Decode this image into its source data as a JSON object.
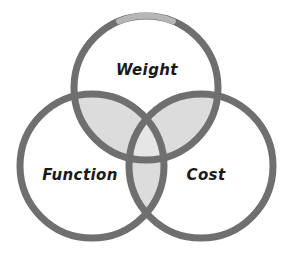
{
  "diagram": {
    "type": "venn-3-circle",
    "background_color": "#ffffff",
    "stroke_color": "#6f6f6f",
    "stroke_width": 7,
    "pair_overlap_fill": "#dcdcdc",
    "triple_overlap_fill": "#e6e6e6",
    "circle_fill": "#ffffff",
    "label_color": "#1a1a1a",
    "circles": [
      {
        "id": "weight",
        "label": "Weight",
        "position": "top",
        "cx": 146,
        "cy": 88,
        "r": 72,
        "label_x": 147,
        "label_y": 70
      },
      {
        "id": "function",
        "label": "Function",
        "position": "bottom-left",
        "cx": 92,
        "cy": 166,
        "r": 72,
        "label_x": 80,
        "label_y": 175
      },
      {
        "id": "cost",
        "label": "Cost",
        "position": "bottom-right",
        "cx": 201,
        "cy": 166,
        "r": 72,
        "label_x": 206,
        "label_y": 175
      }
    ]
  }
}
